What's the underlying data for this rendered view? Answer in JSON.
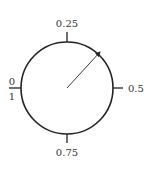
{
  "diagram": {
    "type": "circular-dial",
    "labels": {
      "top": "0.25",
      "right": "0.5",
      "bottom": "0.75",
      "left_numerator": "0",
      "left_denominator": "1"
    },
    "pointer": {
      "value_approx": 0.125,
      "description": "arrow from center toward upper-right"
    },
    "colors": {
      "stroke": "#222222",
      "text": "#333333",
      "background": "#ffffff"
    }
  }
}
